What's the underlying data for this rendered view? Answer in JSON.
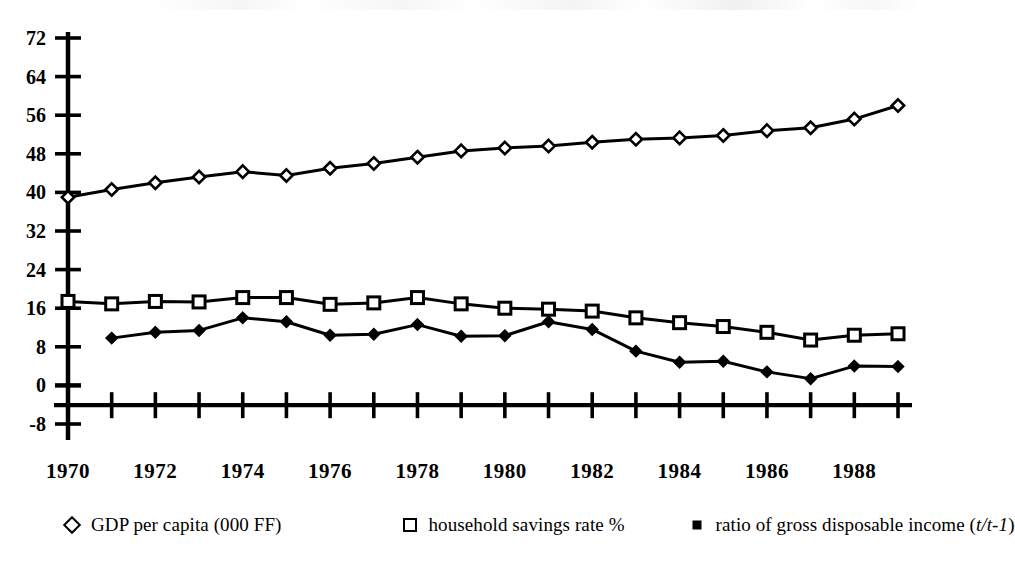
{
  "chart_data": {
    "type": "line",
    "title": "",
    "xlabel": "",
    "ylabel": "",
    "x": [
      1970,
      1971,
      1972,
      1973,
      1974,
      1975,
      1976,
      1977,
      1978,
      1979,
      1980,
      1981,
      1982,
      1983,
      1984,
      1985,
      1986,
      1987,
      1988,
      1989
    ],
    "xlim": [
      1970,
      1989
    ],
    "ylim": [
      -8,
      72
    ],
    "yticks": [
      -8,
      0,
      8,
      16,
      24,
      32,
      40,
      48,
      56,
      64,
      72
    ],
    "ytick_labels": [
      "-8",
      "0",
      "8",
      "16",
      "24",
      "32",
      "40",
      "48",
      "56",
      "64",
      "72"
    ],
    "xtick_labels": [
      "1970",
      "1972",
      "1974",
      "1976",
      "1978",
      "1980",
      "1982",
      "1984",
      "1986",
      "1988"
    ],
    "xtick_values": [
      1970,
      1972,
      1974,
      1976,
      1978,
      1980,
      1982,
      1984,
      1986,
      1988
    ],
    "grid": false,
    "legend_position": "bottom",
    "series": [
      {
        "name": "GDP per capita (000 FF)",
        "marker": "diamond-open",
        "x": [
          1970,
          1971,
          1972,
          1973,
          1974,
          1975,
          1976,
          1977,
          1978,
          1979,
          1980,
          1981,
          1982,
          1983,
          1984,
          1985,
          1986,
          1987,
          1988,
          1989
        ],
        "values": [
          39.0,
          40.6,
          42.0,
          43.2,
          44.3,
          43.5,
          45.0,
          46.0,
          47.3,
          48.6,
          49.2,
          49.6,
          50.4,
          51.0,
          51.3,
          51.8,
          52.8,
          53.4,
          55.2,
          58.0
        ]
      },
      {
        "name": "household savings rate %",
        "marker": "square-open",
        "x": [
          1970,
          1971,
          1972,
          1973,
          1974,
          1975,
          1976,
          1977,
          1978,
          1979,
          1980,
          1981,
          1982,
          1983,
          1984,
          1985,
          1986,
          1987,
          1988,
          1989
        ],
        "values": [
          17.4,
          16.9,
          17.4,
          17.3,
          18.2,
          18.2,
          16.8,
          17.1,
          18.2,
          16.9,
          16.0,
          15.8,
          15.4,
          14.0,
          13.0,
          12.2,
          11.0,
          9.4,
          10.4,
          10.7
        ]
      },
      {
        "name": "ratio of gross disposable income (t/t-1)",
        "marker": "square-filled",
        "x": [
          1971,
          1972,
          1973,
          1974,
          1975,
          1976,
          1977,
          1978,
          1979,
          1980,
          1981,
          1982,
          1983,
          1984,
          1985,
          1986,
          1987,
          1988,
          1989
        ],
        "values": [
          9.8,
          11.0,
          11.4,
          14.0,
          13.2,
          10.4,
          10.6,
          12.6,
          10.2,
          10.3,
          13.2,
          11.6,
          7.1,
          4.8,
          5.0,
          2.8,
          1.4,
          4.0,
          3.9
        ]
      }
    ]
  },
  "legend": {
    "entries": [
      {
        "label": "GDP per capita (000 FF)",
        "marker": "diamond-open-icon"
      },
      {
        "label": "household savings rate %",
        "marker": "square-open-icon"
      },
      {
        "label_plain": "ratio of gross disposable income (",
        "label_italic": "t/t-1",
        "label_tail": ")",
        "marker": "square-filled-icon"
      }
    ]
  }
}
